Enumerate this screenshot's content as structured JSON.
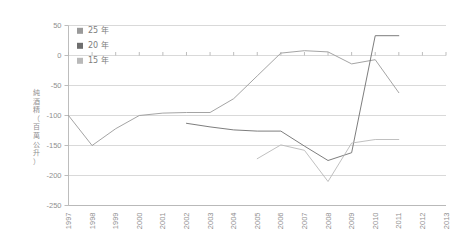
{
  "chart_data": {
    "type": "line",
    "title": "",
    "subtitle": "",
    "xlabel": "",
    "ylabel": "純酒精（百萬公升）",
    "ylabel_chars": [
      "純",
      "酒",
      "精",
      "（",
      "百",
      "萬",
      "公",
      "升",
      "）"
    ],
    "xlim": [
      1997,
      2013
    ],
    "ylim": [
      -250,
      50
    ],
    "y_ticks": [
      50,
      0,
      -50,
      -100,
      -150,
      -200,
      -250
    ],
    "y_tick_labels": [
      "50",
      "0",
      "-50",
      "-100",
      "-150",
      "-200",
      "-250"
    ],
    "x": [
      1997,
      1998,
      1999,
      2000,
      2001,
      2002,
      2003,
      2004,
      2005,
      2006,
      2007,
      2008,
      2009,
      2010,
      2011,
      2012,
      2013
    ],
    "x_tick_labels": [
      "1997",
      "1998",
      "1999",
      "2000",
      "2001",
      "2002",
      "2003",
      "2004",
      "2005",
      "2006",
      "2007",
      "2008",
      "2009",
      "2010",
      "2011",
      "2012",
      "2013"
    ],
    "grid": true,
    "legend_position": "top-left",
    "series": [
      {
        "name": "25 年",
        "color": "#9a9a9a",
        "x": [
          1997,
          1998,
          1999,
          2000,
          2001,
          2002,
          2003,
          2004,
          2005,
          2006,
          2007,
          2008,
          2009,
          2010,
          2011
        ],
        "values": [
          -100,
          -150,
          -122,
          -100,
          -96,
          -95,
          -95,
          -72,
          -34,
          4,
          8,
          6,
          -14,
          -7,
          -62
        ]
      },
      {
        "name": "20 年",
        "color": "#6e6e6e",
        "x": [
          2002,
          2003,
          2004,
          2005,
          2006,
          2007,
          2008,
          2009,
          2010,
          2011
        ],
        "values": [
          -113,
          -119,
          -124,
          -126,
          -126,
          -151,
          -175,
          -162,
          33,
          33
        ]
      },
      {
        "name": "15 年",
        "color": "#b9b9b9",
        "x": [
          2005,
          2006,
          2007,
          2008,
          2009,
          2010,
          2011
        ],
        "values": [
          -172,
          -149,
          -158,
          -210,
          -146,
          -140,
          -140
        ]
      }
    ]
  },
  "legend": {
    "items": [
      {
        "label": "25 年",
        "color": "#9a9a9a"
      },
      {
        "label": "20 年",
        "color": "#6e6e6e"
      },
      {
        "label": "15 年",
        "color": "#b9b9b9"
      }
    ]
  }
}
